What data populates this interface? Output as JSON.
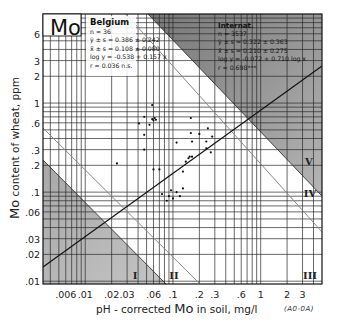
{
  "chart_data": {
    "type": "scatter",
    "title": "Mo",
    "xlabel": "pH - corrected Mo in soil, mg/l",
    "ylabel": "Mo content of wheat, ppm",
    "x_scale": "log",
    "y_scale": "log",
    "xlim": [
      0.0033,
      5
    ],
    "ylim": [
      0.0093,
      10
    ],
    "grid": true,
    "x_ticks": [
      ".006",
      ".01",
      ".02",
      ".03",
      ".06",
      ".1",
      ".2",
      ".3",
      ".6",
      "1",
      "2",
      "3"
    ],
    "x_tick_values": [
      0.006,
      0.01,
      0.02,
      0.03,
      0.06,
      0.1,
      0.2,
      0.3,
      0.6,
      1,
      2,
      3
    ],
    "y_ticks": [
      "6",
      "3",
      "2",
      "1",
      ".6",
      ".3",
      ".2",
      ".1",
      ".06",
      ".03",
      ".02",
      ".01"
    ],
    "y_tick_values": [
      6,
      3,
      2,
      1,
      0.6,
      0.3,
      0.2,
      0.1,
      0.06,
      0.03,
      0.02,
      0.01
    ],
    "series": [
      {
        "name": "Belgium",
        "points": [
          {
            "x": 0.058,
            "y": 0.95
          },
          {
            "x": 0.047,
            "y": 0.7
          },
          {
            "x": 0.058,
            "y": 0.66
          },
          {
            "x": 0.06,
            "y": 0.64
          },
          {
            "x": 0.062,
            "y": 0.68
          },
          {
            "x": 0.064,
            "y": 0.65
          },
          {
            "x": 0.041,
            "y": 0.59
          },
          {
            "x": 0.054,
            "y": 0.57
          },
          {
            "x": 0.047,
            "y": 0.44
          },
          {
            "x": 0.047,
            "y": 0.3
          },
          {
            "x": 0.023,
            "y": 0.21
          },
          {
            "x": 0.16,
            "y": 0.68
          },
          {
            "x": 0.16,
            "y": 0.46
          },
          {
            "x": 0.165,
            "y": 0.37
          },
          {
            "x": 0.2,
            "y": 0.45
          },
          {
            "x": 0.25,
            "y": 0.52
          },
          {
            "x": 0.24,
            "y": 0.37
          },
          {
            "x": 0.24,
            "y": 0.31
          },
          {
            "x": 0.27,
            "y": 0.28
          },
          {
            "x": 0.28,
            "y": 0.42
          },
          {
            "x": 0.11,
            "y": 0.36
          },
          {
            "x": 0.14,
            "y": 0.22
          },
          {
            "x": 0.15,
            "y": 0.24
          },
          {
            "x": 0.155,
            "y": 0.25
          },
          {
            "x": 0.165,
            "y": 0.25
          },
          {
            "x": 0.06,
            "y": 0.18
          },
          {
            "x": 0.07,
            "y": 0.18
          },
          {
            "x": 0.13,
            "y": 0.17
          },
          {
            "x": 0.11,
            "y": 0.1
          },
          {
            "x": 0.12,
            "y": 0.09
          },
          {
            "x": 0.09,
            "y": 0.09
          },
          {
            "x": 0.1,
            "y": 0.085
          },
          {
            "x": 0.085,
            "y": 0.08
          },
          {
            "x": 0.075,
            "y": 0.095
          },
          {
            "x": 0.095,
            "y": 0.105
          },
          {
            "x": 0.13,
            "y": 0.11
          }
        ]
      }
    ],
    "regression_line": {
      "label": "International: log y = -0.072 + 0.710 log x",
      "intercept": -0.072,
      "slope": 0.71
    },
    "regions": [
      {
        "label": "I",
        "description": "shaded lower-left triangle"
      },
      {
        "label": "II",
        "description": "between lower-left shaded area and middle diagonal"
      },
      {
        "label": "III",
        "description": "lower-right area"
      },
      {
        "label": "IV",
        "description": "between upper diagonal lines"
      },
      {
        "label": "V",
        "description": "shaded upper-right triangle"
      }
    ],
    "annotations": {
      "belgium": {
        "title": "Belgium",
        "lines": [
          "n = 36",
          "ȳ ± s = 0.386 ± 0.242",
          "x̄ ± s = 0.108 ± 0.080",
          "log y = -0.538 + 0.157 x",
          "r = 0.036 n.s."
        ]
      },
      "international": {
        "title": "Internat.",
        "lines": [
          "n = 3537",
          "ȳ ± s = 0.322 ± 0.363",
          "x̄ ± s = 0.210 ± 0.275",
          "log y = -0.072 + 0.710 log x",
          "r = 0.698***"
        ]
      }
    }
  },
  "labels": {
    "element": "Mo",
    "ylabel_element": "Mo",
    "ylabel_rest": " content of  wheat, ppm",
    "xlabel_pre": "pH - corrected ",
    "xlabel_element": "Mo",
    "xlabel_post": " in soil, mg/l",
    "figure_code": "(A0-0A)",
    "region_I": "I",
    "region_II": "II",
    "region_III": "III",
    "region_IV": "IV",
    "region_V": "V"
  },
  "belgium_panel": {
    "title": "Belgium",
    "l1": "n = 36",
    "l2": "ȳ ± s = 0.386 ± 0.242",
    "l3": "x̄ ± s = 0.108 ± 0.080",
    "l4": "log y = -0.538 + 0.157 x",
    "l5": "r = 0.036 n.s."
  },
  "intl_panel": {
    "title": "Internat.",
    "l1": "n = 3537",
    "l2": "ȳ ± s = 0.322 ± 0.363",
    "l3": "x̄ ± s = 0.210 ± 0.275",
    "l4": "log y = -0.072 + 0.710 log x",
    "l5": "r = 0.698***"
  },
  "colors": {
    "shade_dark": "#8f8f8f",
    "shade_light": "#bdbdbd",
    "grid": "#333333",
    "frame": "#111111"
  }
}
